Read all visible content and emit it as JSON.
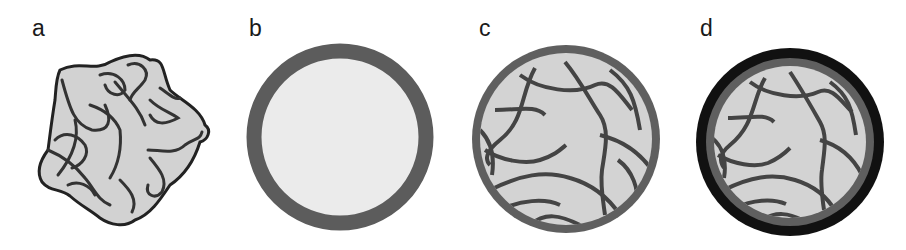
{
  "figure": {
    "panels": [
      {
        "id": "a",
        "label": "a",
        "description": "crumpled irregular blob with tangled filaments"
      },
      {
        "id": "b",
        "label": "b",
        "description": "sphere with uniform gray shell and light interior"
      },
      {
        "id": "c",
        "label": "c",
        "description": "sphere with gray shell and internal filament network"
      },
      {
        "id": "d",
        "label": "d",
        "description": "sphere with black outer shell, gray inner shell and internal filament network"
      }
    ],
    "colors": {
      "background": "#ffffff",
      "fill_light": "#d4d4d4",
      "fill_lighter": "#e8e8e8",
      "shell_gray": "#5f5f5f",
      "filament_dark": "#3a3a3a",
      "outer_black": "#111111"
    }
  }
}
